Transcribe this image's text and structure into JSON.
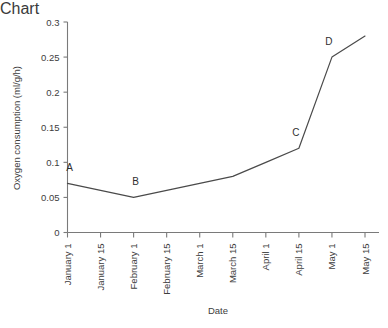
{
  "chart_data": {
    "type": "line",
    "title": "",
    "xlabel": "Date",
    "ylabel": "Oxygen consumption (ml/g/h)",
    "categories": [
      "January 1",
      "January 15",
      "February 1",
      "February 15",
      "March 1",
      "March 15",
      "April 1",
      "April 15",
      "May 1",
      "May 15"
    ],
    "values": [
      0.07,
      0.06,
      0.05,
      0.06,
      0.07,
      0.08,
      0.1,
      0.12,
      0.25,
      0.28
    ],
    "ylim": [
      0,
      0.3
    ],
    "ytick_labels": [
      "0",
      "0.05",
      "0.1",
      "0.15",
      "0.2",
      "0.25",
      "0.3"
    ],
    "ytick_values": [
      0,
      0.05,
      0.1,
      0.15,
      0.2,
      0.25,
      0.3
    ],
    "grid": false,
    "legend": false,
    "line_color": "#4a4a4a",
    "axis_color": "#7a7a7a",
    "annotations": [
      {
        "label": "A",
        "x": "January 1",
        "y": 0.07
      },
      {
        "label": "B",
        "x": "February 1",
        "y": 0.05
      },
      {
        "label": "C",
        "x": "April 15",
        "y": 0.12
      },
      {
        "label": "D",
        "x": "May 1",
        "y": 0.25
      }
    ]
  }
}
